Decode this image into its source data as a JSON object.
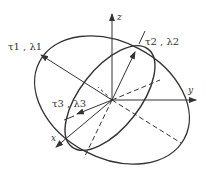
{
  "diagram": {
    "type": "ellipsoid-principal-axes",
    "axes": {
      "x": "x",
      "y": "y",
      "z": "z"
    },
    "principal_labels": {
      "p1": "τ1 , λ1",
      "p2": "τ2 , λ2",
      "p3": "τ3 , λ3"
    },
    "colors": {
      "stroke": "#333333",
      "background": "#ffffff"
    }
  }
}
